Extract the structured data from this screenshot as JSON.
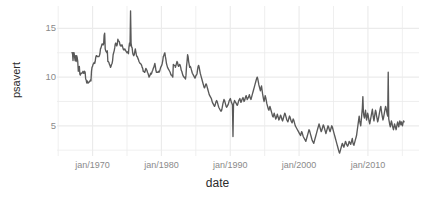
{
  "chart_data": {
    "type": "line",
    "title": "",
    "xlabel": "date",
    "ylabel": "psavert",
    "xlim": [
      "jan/1967",
      "apr/2015"
    ],
    "ylim": [
      1.9,
      17.3
    ],
    "grid": true,
    "legend": "none",
    "line_color": "#595959",
    "panel_background": "#ffffff",
    "gridline_color": "#ebebeb",
    "axis_text_color": "#8a8a8a",
    "axis_title_color": "#2b2b2b",
    "y_ticks": [
      5,
      10,
      15
    ],
    "y_tick_labels": [
      "5",
      "10",
      "15"
    ],
    "x_ticks": [
      "jan/1970",
      "jan/1980",
      "jan/1990",
      "jan/2000",
      "jan/2010"
    ],
    "x_tick_years": [
      1970,
      1980,
      1990,
      2000,
      2010
    ],
    "x_minor_gridline_years": [
      1965,
      1975,
      1985,
      1995,
      2005,
      2015
    ],
    "series": [
      {
        "name": "psavert",
        "x_start_year": 1967.0,
        "x_end_year": 2015.25,
        "x_step_years": 0.0833333,
        "values": [
          12.5,
          12.5,
          11.7,
          12.5,
          12.5,
          12.1,
          11.7,
          12.2,
          11.6,
          12.2,
          12.0,
          11.6,
          10.6,
          10.7,
          11.1,
          10.3,
          10.2,
          10.4,
          10.4,
          10.4,
          10.5,
          10.6,
          10.4,
          10.4,
          10.6,
          10.5,
          9.8,
          9.7,
          9.4,
          9.6,
          9.4,
          9.4,
          9.5,
          9.5,
          9.6,
          9.7,
          9.6,
          10.6,
          11.0,
          11.1,
          11.3,
          11.4,
          11.5,
          11.4,
          11.6,
          12.0,
          12.2,
          12.2,
          12.1,
          12.1,
          12.1,
          12.1,
          12.2,
          12.4,
          12.9,
          13.0,
          13.2,
          13.4,
          13.4,
          13.3,
          13.4,
          14.3,
          14.5,
          12.9,
          12.7,
          12.6,
          12.5,
          12.7,
          11.6,
          11.6,
          11.5,
          11.3,
          11.2,
          11.0,
          11.1,
          11.3,
          11.4,
          11.7,
          12.3,
          12.5,
          12.7,
          13.0,
          13.4,
          13.5,
          13.3,
          13.2,
          13.4,
          13.9,
          13.7,
          13.7,
          13.6,
          13.3,
          13.2,
          13.3,
          13.2,
          13.3,
          13.1,
          12.9,
          12.8,
          12.8,
          12.9,
          12.8,
          12.7,
          12.6,
          12.5,
          12.6,
          12.5,
          12.4,
          13.1,
          13.5,
          13.2,
          16.8,
          13.5,
          13.1,
          13.0,
          12.5,
          12.3,
          12.2,
          12.3,
          12.6,
          12.9,
          12.6,
          12.3,
          12.1,
          12.1,
          11.9,
          11.8,
          11.6,
          11.5,
          11.4,
          11.4,
          11.3,
          11.2,
          11.0,
          10.9,
          10.6,
          10.6,
          10.5,
          10.5,
          10.7,
          10.9,
          10.8,
          10.7,
          10.5,
          10.4,
          10.2,
          10.0,
          10.1,
          10.2,
          10.4,
          10.3,
          10.4,
          10.6,
          10.7,
          10.9,
          11.0,
          11.2,
          11.4,
          11.1,
          10.7,
          10.5,
          10.5,
          10.5,
          10.5,
          10.6,
          10.5,
          10.6,
          10.8,
          11.0,
          11.1,
          11.2,
          11.4,
          11.7,
          12.1,
          12.2,
          12.4,
          12.5,
          12.1,
          11.8,
          11.4,
          11.2,
          11.0,
          10.9,
          10.8,
          10.7,
          10.6,
          10.5,
          10.3,
          10.2,
          10.2,
          10.1,
          10.0,
          11.3,
          11.2,
          11.2,
          11.2,
          11.0,
          11.2,
          11.4,
          11.6,
          11.5,
          11.2,
          11.1,
          11.2,
          11.3,
          11.2,
          11.0,
          10.7,
          10.6,
          10.4,
          10.2,
          10.1,
          10.0,
          10.0,
          9.9,
          9.8,
          10.2,
          11.1,
          11.6,
          12.3,
          12.1,
          11.6,
          11.3,
          11.0,
          11.1,
          11.0,
          10.8,
          10.6,
          10.4,
          10.3,
          10.2,
          10.1,
          10.0,
          9.9,
          10.0,
          10.2,
          10.2,
          10.4,
          10.8,
          11.1,
          11.2,
          11.0,
          10.7,
          10.4,
          10.2,
          10.0,
          9.8,
          9.6,
          9.4,
          9.2,
          9.0,
          8.9,
          9.0,
          9.2,
          9.3,
          9.2,
          9.0,
          8.8,
          8.6,
          8.4,
          8.2,
          8.1,
          8.0,
          7.9,
          7.8,
          7.6,
          7.4,
          7.3,
          7.2,
          7.1,
          7.0,
          7.1,
          7.3,
          7.5,
          7.6,
          7.5,
          7.3,
          7.1,
          6.9,
          6.8,
          6.7,
          6.6,
          6.5,
          6.5,
          6.7,
          7.0,
          7.3,
          7.5,
          7.7,
          7.6,
          7.4,
          7.2,
          7.0,
          6.9,
          7.0,
          7.1,
          7.2,
          7.4,
          7.6,
          7.7,
          7.8,
          7.6,
          7.4,
          7.3,
          7.1,
          3.9,
          7.2,
          7.4,
          7.6,
          7.5,
          7.4,
          7.3,
          7.2,
          7.1,
          7.2,
          7.4,
          7.6,
          7.7,
          7.8,
          7.6,
          7.4,
          7.5,
          7.7,
          7.8,
          7.9,
          7.7,
          7.5,
          7.6,
          7.8,
          8.0,
          8.1,
          7.9,
          7.7,
          7.8,
          7.9,
          8.0,
          8.2,
          8.0,
          7.8,
          7.7,
          7.9,
          8.1,
          8.3,
          8.5,
          8.7,
          8.9,
          9.1,
          9.3,
          9.5,
          9.7,
          9.9,
          10.0,
          9.8,
          9.5,
          9.2,
          9.0,
          8.8,
          8.6,
          8.9,
          9.1,
          8.7,
          8.3,
          8.0,
          7.7,
          7.5,
          7.8,
          8.1,
          7.9,
          7.6,
          7.3,
          7.1,
          6.9,
          6.7,
          6.6,
          6.8,
          7.0,
          6.8,
          6.6,
          6.4,
          6.2,
          6.0,
          5.9,
          6.1,
          6.3,
          6.1,
          5.9,
          5.7,
          5.8,
          6.0,
          6.2,
          6.0,
          5.8,
          5.6,
          5.7,
          5.9,
          6.1,
          6.0,
          5.8,
          5.6,
          5.5,
          5.7,
          5.9,
          6.1,
          6.3,
          6.2,
          6.0,
          5.8,
          5.6,
          5.5,
          5.4,
          5.6,
          5.8,
          6.0,
          5.9,
          5.7,
          5.5,
          5.4,
          5.3,
          5.5,
          5.7,
          5.6,
          5.4,
          5.2,
          5.0,
          4.9,
          4.8,
          4.7,
          4.6,
          4.5,
          4.4,
          4.3,
          4.2,
          4.1,
          4.0,
          4.2,
          4.4,
          4.3,
          4.1,
          3.9,
          3.8,
          3.7,
          3.6,
          3.5,
          3.4,
          3.6,
          3.8,
          4.0,
          4.2,
          4.4,
          4.6,
          4.5,
          4.3,
          4.1,
          3.9,
          3.7,
          3.5,
          3.4,
          3.3,
          3.2,
          3.4,
          3.6,
          3.8,
          4.0,
          4.2,
          4.4,
          4.6,
          4.8,
          5.0,
          5.2,
          5.0,
          4.8,
          4.6,
          4.4,
          4.5,
          4.7,
          4.9,
          5.1,
          5.0,
          4.8,
          4.6,
          4.4,
          4.2,
          4.4,
          4.6,
          4.8,
          5.0,
          4.9,
          4.7,
          4.5,
          4.4,
          4.6,
          4.8,
          5.0,
          4.9,
          4.7,
          4.5,
          4.3,
          4.1,
          3.9,
          3.7,
          3.5,
          3.3,
          3.1,
          2.9,
          2.7,
          2.5,
          2.3,
          2.2,
          2.4,
          2.6,
          2.8,
          3.0,
          3.2,
          3.1,
          2.9,
          2.8,
          3.0,
          3.2,
          3.4,
          3.3,
          3.1,
          3.0,
          2.9,
          3.0,
          3.2,
          3.4,
          3.3,
          3.2,
          3.1,
          3.3,
          3.5,
          3.7,
          3.3,
          3.1,
          3.0,
          3.2,
          3.4,
          3.6,
          3.8,
          4.0,
          4.4,
          4.8,
          5.2,
          5.6,
          6.0,
          5.5,
          5.2,
          5.0,
          5.6,
          6.2,
          6.8,
          8.0,
          6.4,
          6.0,
          5.8,
          6.2,
          6.6,
          6.0,
          5.6,
          5.9,
          6.3,
          6.1,
          5.7,
          5.4,
          5.2,
          5.5,
          5.8,
          6.1,
          6.4,
          6.7,
          6.2,
          5.8,
          5.5,
          5.9,
          6.3,
          6.6,
          6.4,
          6.0,
          5.7,
          5.4,
          5.6,
          5.9,
          6.2,
          6.5,
          6.8,
          7.0,
          6.6,
          6.2,
          5.9,
          5.6,
          5.8,
          6.1,
          6.4,
          6.7,
          7.0,
          6.8,
          6.5,
          6.2,
          6.0,
          10.5,
          5.7,
          5.4,
          5.1,
          4.9,
          5.2,
          5.5,
          5.3,
          5.0,
          4.8,
          4.6,
          4.9,
          5.2,
          5.0,
          4.8,
          4.6,
          4.9,
          5.2,
          5.4,
          5.1,
          4.9,
          5.2,
          5.5,
          5.3,
          5.1,
          5.4,
          5.2,
          5.0,
          5.3,
          5.5,
          5.4
        ]
      }
    ]
  }
}
